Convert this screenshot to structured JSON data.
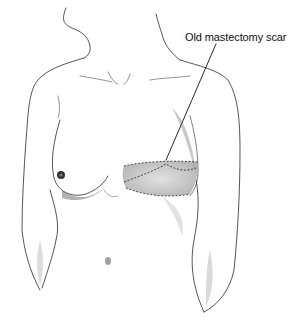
{
  "figure": {
    "callouts": [
      {
        "label": "Old mastectomy scar",
        "target": "scar"
      }
    ]
  },
  "colors": {
    "background": "#ffffff",
    "line": "#2a2a2a",
    "shade": "#9a9a9a",
    "label": "#111111"
  }
}
